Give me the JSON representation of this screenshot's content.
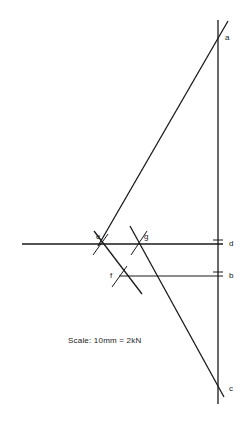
{
  "diagram": {
    "kind": "force-polygon",
    "background_color": "#ffffff",
    "stroke_color": "#1a1a1a",
    "scale_note": "Scale: 10mm = 2kN",
    "scale_note_position": {
      "x": 68,
      "y": 337
    },
    "labels": [
      {
        "id": "a",
        "text": "a",
        "x": 225,
        "y": 34
      },
      {
        "id": "e",
        "text": "e",
        "x": 96,
        "y": 233
      },
      {
        "id": "g",
        "text": "g",
        "x": 144,
        "y": 233
      },
      {
        "id": "d",
        "text": "d",
        "x": 229,
        "y": 240
      },
      {
        "id": "f",
        "text": "f",
        "x": 110,
        "y": 272
      },
      {
        "id": "b",
        "text": "b",
        "x": 229,
        "y": 272
      },
      {
        "id": "c",
        "text": "c",
        "x": 229,
        "y": 385
      }
    ],
    "points": [
      {
        "id": "a",
        "x": 218,
        "y": 38
      },
      {
        "id": "b",
        "x": 218,
        "y": 276
      },
      {
        "id": "c",
        "x": 218,
        "y": 388
      },
      {
        "id": "d",
        "x": 218,
        "y": 244
      },
      {
        "id": "e",
        "x": 100,
        "y": 244
      },
      {
        "id": "f",
        "x": 119,
        "y": 276
      },
      {
        "id": "g",
        "x": 139,
        "y": 244
      }
    ],
    "lines": [
      {
        "id": "load-line-vertical",
        "x1": 218,
        "y1": 20,
        "x2": 218,
        "y2": 404,
        "width": 1.3
      },
      {
        "id": "ray-d-horizontal",
        "x1": 22,
        "y1": 244,
        "x2": 223,
        "y2": 244,
        "width": 1.3
      },
      {
        "id": "ray-b-horizontal",
        "x1": 119,
        "y1": 276,
        "x2": 223,
        "y2": 276,
        "width": 1.1
      },
      {
        "id": "ray-e-a",
        "x1": 98,
        "y1": 246,
        "x2": 228,
        "y2": 21,
        "width": 1.3
      },
      {
        "id": "ray-g-c",
        "x1": 130,
        "y1": 226,
        "x2": 224,
        "y2": 397,
        "width": 1.3
      },
      {
        "id": "ray-e-f-extended",
        "x1": 94,
        "y1": 231,
        "x2": 142,
        "y2": 294,
        "width": 1.3
      },
      {
        "id": "arc-tick-e",
        "x1": 93,
        "y1": 255,
        "x2": 108,
        "y2": 234,
        "width": 1.0
      },
      {
        "id": "arc-tick-g",
        "x1": 131,
        "y1": 255,
        "x2": 147,
        "y2": 231,
        "width": 1.0
      },
      {
        "id": "arc-tick-f",
        "x1": 112,
        "y1": 287,
        "x2": 127,
        "y2": 266,
        "width": 1.0
      }
    ],
    "tick_marks": [
      {
        "id": "tick-d",
        "x1": 213,
        "y1": 240,
        "x2": 223,
        "y2": 240,
        "width": 1.0
      },
      {
        "id": "tick-b",
        "x1": 213,
        "y1": 272,
        "x2": 223,
        "y2": 272,
        "width": 1.0
      }
    ]
  }
}
